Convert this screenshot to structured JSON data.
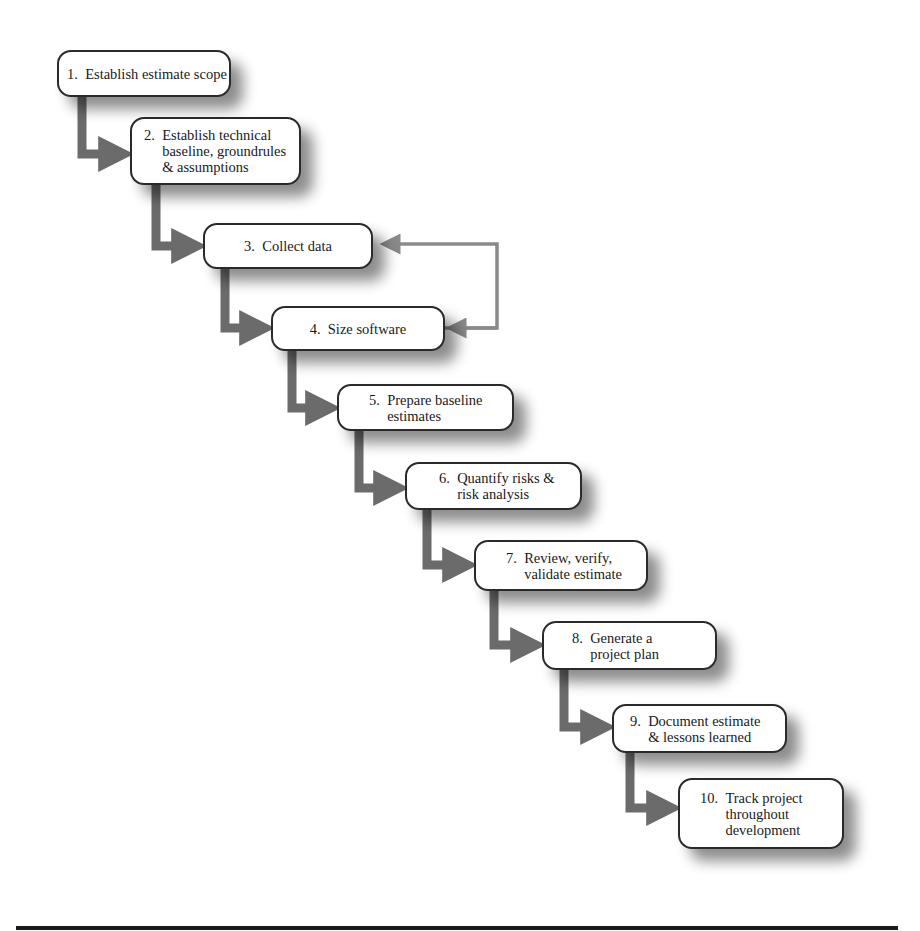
{
  "diagram": {
    "type": "flowchart-staircase",
    "colors": {
      "arrow": "#6b6b6b",
      "feedback_arrow": "#8a8a8a",
      "box_border": "#2a2a2a",
      "box_fill": "#ffffff",
      "rule": "#1a1a1a"
    },
    "steps": [
      {
        "num": "1.",
        "text": "Establish estimate scope"
      },
      {
        "num": "2.",
        "text": "Establish technical\nbaseline, groundrules\n& assumptions"
      },
      {
        "num": "3.",
        "text": "Collect data"
      },
      {
        "num": "4.",
        "text": "Size software"
      },
      {
        "num": "5.",
        "text": "Prepare baseline\nestimates"
      },
      {
        "num": "6.",
        "text": "Quantify risks &\nrisk analysis"
      },
      {
        "num": "7.",
        "text": "Review, verify,\nvalidate estimate"
      },
      {
        "num": "8.",
        "text": "Generate a\nproject plan"
      },
      {
        "num": "9.",
        "text": "Document estimate\n& lessons learned"
      },
      {
        "num": "10.",
        "text": "Track project\nthroughout\ndevelopment"
      }
    ],
    "feedback_loop": {
      "from": "4. Size software",
      "to": "3. Collect data"
    }
  }
}
